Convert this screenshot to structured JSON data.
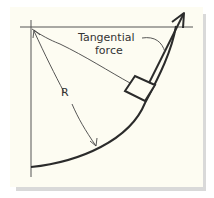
{
  "diagram": {
    "labels": {
      "tangential_force_line1": "Tangential",
      "tangential_force_line2": "force",
      "radius": "R"
    },
    "colors": {
      "background": "#fdfcf2",
      "ink": "#2b2b2b",
      "axis": "#555555",
      "shadow": "#d9d9d9"
    }
  }
}
